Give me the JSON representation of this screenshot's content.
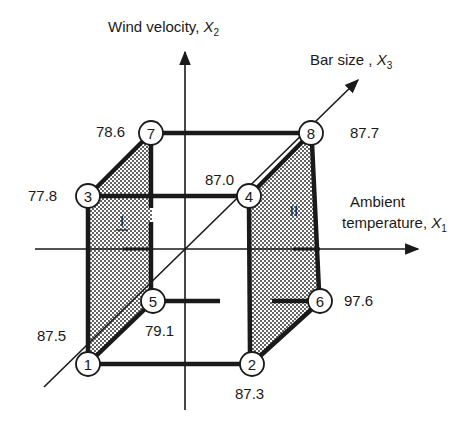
{
  "diagram": {
    "type": "cube design (2^3 factorial) with corner responses",
    "axes": {
      "x1": {
        "label": "Ambient",
        "label2": "temperature",
        "symbol": "X",
        "sub": "1"
      },
      "x2": {
        "label": "Wind velocity",
        "symbol": "X",
        "sub": "2"
      },
      "x3": {
        "label": "Bar size",
        "symbol": "X",
        "sub": "3"
      }
    },
    "nodes": [
      {
        "id": "1",
        "value": "87.5"
      },
      {
        "id": "2",
        "value": "87.3"
      },
      {
        "id": "3",
        "value": "77.8"
      },
      {
        "id": "4",
        "value": "87.0"
      },
      {
        "id": "5",
        "value": "79.1"
      },
      {
        "id": "6",
        "value": "97.6"
      },
      {
        "id": "7",
        "value": "78.6"
      },
      {
        "id": "8",
        "value": "87.7"
      }
    ],
    "faces": [
      {
        "id": "I",
        "label": "I",
        "nodes": [
          "1",
          "3",
          "5",
          "7"
        ]
      },
      {
        "id": "II",
        "label": "II",
        "nodes": [
          "2",
          "4",
          "6",
          "8"
        ]
      }
    ],
    "colors": {
      "ink": "#1a1a1a",
      "background": "#ffffff"
    }
  }
}
